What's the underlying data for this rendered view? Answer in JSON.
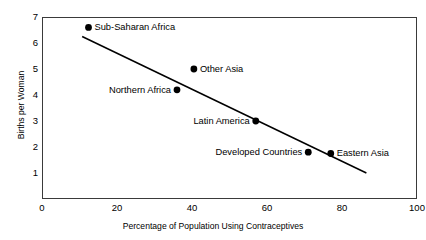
{
  "chart_data": {
    "type": "scatter",
    "title": "",
    "xlabel": "Percentage of Population Using Contraceptives",
    "ylabel": "Births per Woman",
    "xlim": [
      0,
      100
    ],
    "ylim": [
      0,
      7
    ],
    "xticks": [
      "0",
      "20",
      "40",
      "60",
      "80",
      "100"
    ],
    "yticks": [
      "1",
      "2",
      "3",
      "4",
      "5",
      "6",
      "7"
    ],
    "grid": false,
    "legend": "none",
    "points": [
      {
        "label": "Sub-Saharan Africa",
        "x": 12.4,
        "y": 6.6,
        "label_side": "right"
      },
      {
        "label": "Other Asia",
        "x": 40.5,
        "y": 5.0,
        "label_side": "right"
      },
      {
        "label": "Northern Africa",
        "x": 36.0,
        "y": 4.2,
        "label_side": "left"
      },
      {
        "label": "Latin America",
        "x": 57.0,
        "y": 3.0,
        "label_side": "left"
      },
      {
        "label": "Developed Countries",
        "x": 71.0,
        "y": 1.8,
        "label_side": "left"
      },
      {
        "label": "Eastern Asia",
        "x": 77.0,
        "y": 1.75,
        "label_side": "right"
      }
    ],
    "trend_line": {
      "x1": 10.7,
      "y1": 6.25,
      "x2": 86.5,
      "y2": 1.0
    },
    "colors": {
      "marker": "#000000",
      "line": "#000000",
      "frame": "#3a3a3a",
      "background": "#ffffff"
    }
  }
}
